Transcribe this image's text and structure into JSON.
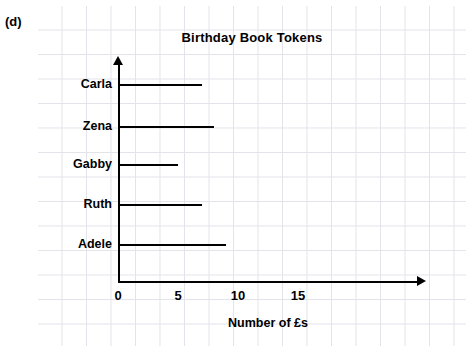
{
  "part_label": "(d)",
  "chart_data": {
    "type": "bar",
    "orientation": "horizontal",
    "title": "Birthday Book Tokens",
    "xlabel": "Number of £s",
    "ylabel": "",
    "categories": [
      "Carla",
      "Zena",
      "Gabby",
      "Ruth",
      "Adele"
    ],
    "values": [
      7,
      8,
      5,
      7,
      9
    ],
    "xlim": [
      0,
      16
    ],
    "xticks": [
      0,
      5,
      10,
      15
    ],
    "xtick_labels": [
      "0",
      "5",
      "10",
      "15"
    ],
    "grid": true,
    "legend": null,
    "bar_style": "line",
    "color": "#000000"
  }
}
